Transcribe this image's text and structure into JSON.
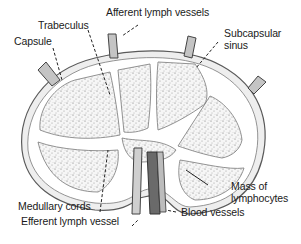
{
  "diagram": {
    "labels": {
      "trabeculus": "Trabeculus",
      "afferent": "Afferent lymph vessels",
      "capsule": "Capsule",
      "subcapsular_1": "Subcapsular",
      "subcapsular_2": "sinus",
      "mass_1": "Mass of",
      "mass_2": "lymphocytes",
      "medullary": "Medullary cords",
      "efferent": "Efferent lymph vessel",
      "blood": "Blood vessels"
    },
    "colors": {
      "outline": "#5a5a5a",
      "capsule_fill": "#eeeeee",
      "lobule_fill": "#f4f4f4",
      "stipple": "#6b6b6b",
      "vessel_fill": "#bdbdbd",
      "vessel_dark": "#555555",
      "text": "#1a1a1a"
    }
  }
}
